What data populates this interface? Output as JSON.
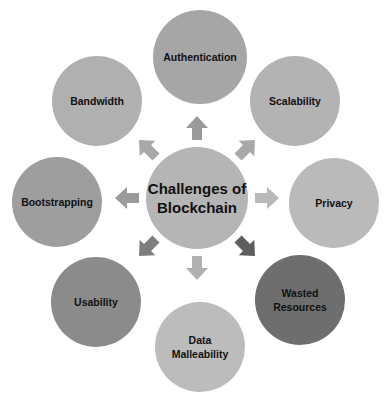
{
  "diagram": {
    "type": "radial-hub",
    "center": {
      "label": "Challenges of\nBlockchain",
      "x": 197,
      "y": 198,
      "r": 51,
      "color": "#b5b5b5"
    },
    "nodes": [
      {
        "id": "authentication",
        "label": "Authentication",
        "x": 200,
        "y": 57,
        "r": 47,
        "color": "#a6a6a6"
      },
      {
        "id": "scalability",
        "label": "Scalability",
        "x": 295,
        "y": 101,
        "r": 45,
        "color": "#b3b3b3"
      },
      {
        "id": "privacy",
        "label": "Privacy",
        "x": 334,
        "y": 203,
        "r": 45,
        "color": "#bababa"
      },
      {
        "id": "wasted-resources",
        "label": "Wasted\nResources",
        "x": 300,
        "y": 300,
        "r": 45,
        "color": "#6e6e6e"
      },
      {
        "id": "data-malleability",
        "label": "Data\nMalleability",
        "x": 200,
        "y": 347,
        "r": 45,
        "color": "#bcbcbc"
      },
      {
        "id": "usability",
        "label": "Usability",
        "x": 96,
        "y": 302,
        "r": 45,
        "color": "#8b8b8b"
      },
      {
        "id": "bootstrapping",
        "label": "Bootstrapping",
        "x": 57,
        "y": 202,
        "r": 45,
        "color": "#9e9e9e"
      },
      {
        "id": "bandwidth",
        "label": "Bandwidth",
        "x": 97,
        "y": 101,
        "r": 45,
        "color": "#b0b0b0"
      }
    ],
    "arrows": [
      {
        "to": "authentication",
        "angle": -90,
        "color": "#9a9a9a"
      },
      {
        "to": "scalability",
        "angle": -45,
        "color": "#a8a8a8"
      },
      {
        "to": "privacy",
        "angle": 0,
        "color": "#b8b8b8"
      },
      {
        "to": "wasted-resources",
        "angle": 45,
        "color": "#5e5e5e"
      },
      {
        "to": "data-malleability",
        "angle": 90,
        "color": "#b0b0b0"
      },
      {
        "to": "usability",
        "angle": 135,
        "color": "#7e7e7e"
      },
      {
        "to": "bootstrapping",
        "angle": 180,
        "color": "#9a9a9a"
      },
      {
        "to": "bandwidth",
        "angle": -135,
        "color": "#a8a8a8"
      }
    ]
  }
}
